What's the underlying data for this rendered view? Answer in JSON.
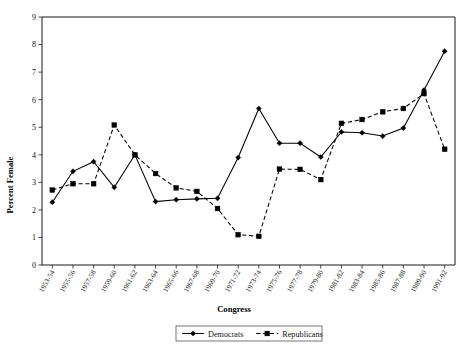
{
  "chart_data": {
    "type": "line",
    "title": "",
    "xlabel": "Congress",
    "ylabel": "Percent Female",
    "ylim": [
      0,
      9
    ],
    "ytick_values": [
      0,
      1,
      2,
      3,
      4,
      5,
      6,
      7,
      8,
      9
    ],
    "ytick_labels": [
      "0",
      "1",
      "2",
      "3",
      "4",
      "5",
      "6",
      "7",
      "8",
      "9"
    ],
    "grid": false,
    "legend_position": "bottom-center",
    "categories": [
      "1953-54",
      "1955-56",
      "1957-58",
      "1959-60",
      "1961-62",
      "1963-64",
      "1965-66",
      "1967-68",
      "1969-70",
      "1971-72",
      "1973-74",
      "1975-76",
      "1977-78",
      "1979-80",
      "1981-82",
      "1983-84",
      "1985-86",
      "1987-88",
      "1989-90",
      "1991-92"
    ],
    "series": [
      {
        "name": "Democrats",
        "marker": "diamond",
        "line_style": "solid",
        "color": "#000000",
        "values": [
          2.28,
          3.4,
          3.75,
          2.82,
          4.0,
          2.3,
          2.37,
          2.4,
          2.42,
          3.9,
          5.68,
          4.42,
          4.42,
          3.92,
          4.83,
          4.8,
          4.68,
          4.97,
          6.35,
          7.76
        ]
      },
      {
        "name": "Republicans",
        "marker": "square",
        "line_style": "dashed",
        "color": "#000000",
        "values": [
          2.72,
          2.95,
          2.95,
          5.08,
          4.0,
          3.32,
          2.8,
          2.67,
          2.05,
          1.1,
          1.04,
          3.48,
          3.47,
          3.1,
          5.14,
          5.28,
          5.56,
          5.68,
          6.22,
          4.2
        ]
      }
    ]
  },
  "legend": {
    "entries": [
      {
        "label": "Democrats",
        "marker": "diamond",
        "style": "solid"
      },
      {
        "label": "Republicans",
        "marker": "square",
        "style": "dashed"
      }
    ]
  }
}
